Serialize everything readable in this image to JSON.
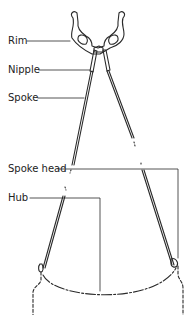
{
  "diagram": {
    "labels": {
      "rim": "Rim",
      "nipple": "Nipple",
      "spoke": "Spoke",
      "spoke_head": "Spoke head",
      "hub": "Hub"
    },
    "colors": {
      "line": "#2a2a2a",
      "background": "#ffffff"
    }
  }
}
